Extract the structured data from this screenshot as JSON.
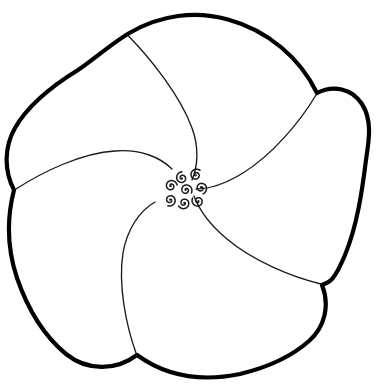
{
  "artwork": {
    "title": "Five-Petal Pinwheel Flower Line Drawing",
    "style": "coloring-book line art",
    "canvas": {
      "width": 376,
      "height": 385
    },
    "background_color": "#ffffff",
    "outline_color": "#000000",
    "outline_width": 4.2,
    "detail_color": "#1a1a1a",
    "detail_width": 1.3,
    "center": {
      "x": 182,
      "y": 187
    },
    "petal_count": 5,
    "spiral_count": 8
  },
  "shapes": {
    "outer_outline": {
      "name": "flower-outer-outline",
      "description": "thick black scalloped contour of five overlapping petals",
      "path": "M 128.5 33.5 C 160 14.5 196 10.5 228 19.5 C 268 30.5 300 58 317 93 C 333 84.5 352 88.5 362 104 C 372.5 120.5 369 140 366 160 C 362 192 357 226 345 255 C 334 281 330 282 322 285 C 330 305 325 327 309 341 C 291 357 265 368 240 374 C 206 381 170 379 137 355 C 116 371 87 371 66 354 C 43 335 27 307 17 278 C 8 251 6 221 14 190 C 4 171 4 147 15 128 C 28 105 52 86 78 70 C 93 60 111 44 128.5 33.5 Z",
      "notches": [
        {
          "name": "notch-top",
          "x": 128.5,
          "y": 33.5
        },
        {
          "name": "notch-right",
          "x": 317,
          "y": 93
        },
        {
          "name": "notch-bottom-right",
          "x": 322,
          "y": 285
        },
        {
          "name": "notch-bottom",
          "x": 137,
          "y": 355
        },
        {
          "name": "notch-left",
          "x": 14,
          "y": 190
        }
      ]
    },
    "petal_dividers": [
      {
        "name": "petal-divider-top",
        "path": "M 128.5 36 C 150 58 180 95 192 128 C 199 147 198 166 192 180"
      },
      {
        "name": "petal-divider-right",
        "path": "M 316 95 C 300 122 272 155 243 173 C 225 184 208 189 196 189"
      },
      {
        "name": "petal-divider-bottom-right",
        "path": "M 321 284 C 292 277 253 261 227 239 C 210 225 199 209 194 196"
      },
      {
        "name": "petal-divider-bottom",
        "path": "M 136 353 C 126 325 118 285 123 253 C 127 230 139 211 155 202"
      },
      {
        "name": "petal-divider-left",
        "path": "M 16 189 C 44 171 82 153 115 151 C 140 149 160 157 172 169"
      }
    ],
    "center_spirals": [
      {
        "name": "center-spiral-1",
        "cx": 182,
        "cy": 178,
        "r": 6.2,
        "rotation": 0
      },
      {
        "name": "center-spiral-2",
        "cx": 196,
        "cy": 175,
        "r": 6.2,
        "rotation": 40
      },
      {
        "name": "center-spiral-3",
        "cx": 171,
        "cy": 186,
        "r": 6.2,
        "rotation": 80
      },
      {
        "name": "center-spiral-4",
        "cx": 186,
        "cy": 190,
        "r": 6.2,
        "rotation": 120
      },
      {
        "name": "center-spiral-5",
        "cx": 201,
        "cy": 188,
        "r": 6.2,
        "rotation": 160
      },
      {
        "name": "center-spiral-6",
        "cx": 170,
        "cy": 200,
        "r": 6.2,
        "rotation": 200
      },
      {
        "name": "center-spiral-7",
        "cx": 184,
        "cy": 203,
        "r": 6.2,
        "rotation": 240
      },
      {
        "name": "center-spiral-8",
        "cx": 198,
        "cy": 201,
        "r": 6.2,
        "rotation": 300
      }
    ]
  }
}
